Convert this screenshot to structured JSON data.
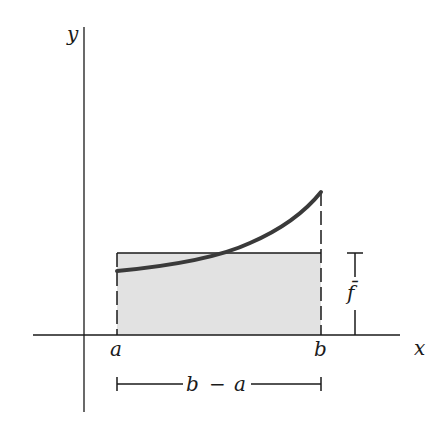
{
  "diagram": {
    "axes": {
      "x_label": "x",
      "y_label": "y"
    },
    "points": {
      "a": "a",
      "b": "b"
    },
    "mean_value_label": "f̄",
    "width_label": {
      "left": "b",
      "minus": "−",
      "right": "a"
    },
    "colors": {
      "ink": "#1a1a1a",
      "curve": "#3a3a3a",
      "fill": "#e2e2e2"
    }
  }
}
